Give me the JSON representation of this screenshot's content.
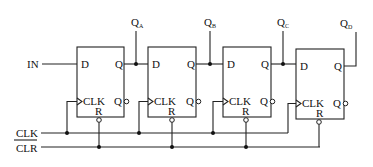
{
  "diagram": {
    "inputs": {
      "data": "IN",
      "clock": "CLK",
      "clear": "CLR"
    },
    "flip_flops": [
      {
        "d": "D",
        "q": "Q",
        "qbar": "Q",
        "clk": "CLK",
        "reset": "R",
        "output_main": "Q",
        "output_sub": "A"
      },
      {
        "d": "D",
        "q": "Q",
        "qbar": "Q",
        "clk": "CLK",
        "reset": "R",
        "output_main": "Q",
        "output_sub": "B"
      },
      {
        "d": "D",
        "q": "Q",
        "qbar": "Q",
        "clk": "CLK",
        "reset": "R",
        "output_main": "Q",
        "output_sub": "C"
      },
      {
        "d": "D",
        "q": "Q",
        "qbar": "Q",
        "clk": "CLK",
        "reset": "R",
        "output_main": "Q",
        "output_sub": "D"
      }
    ]
  }
}
